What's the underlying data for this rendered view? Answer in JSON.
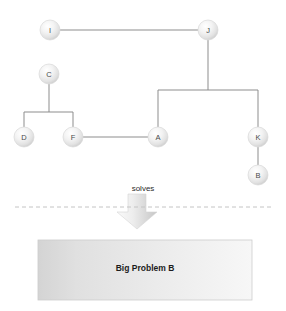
{
  "diagram": {
    "title": "",
    "type": "node-link-graph-with-solves-relation",
    "colors": {
      "background": "#ffffff",
      "edge": "#8d8d8d",
      "node_fill_light": "#fdfdfd",
      "node_fill_mid": "#e8e8e8",
      "node_fill_dark": "#cfcfcf",
      "node_stroke": "#d9d9d9",
      "node_text": "#4a4a4a",
      "divider": "#c8c8c8",
      "arrow_light": "#f2f2f2",
      "arrow_dark": "#c9c9c9",
      "box_left": "#d6d6d6",
      "box_mid": "#e9e9e9",
      "box_right": "#f4f4f4",
      "box_stroke": "#cccccc",
      "box_text": "#1c1c1c",
      "relation_text": "#2b2b2b"
    },
    "nodes": [
      {
        "id": "I",
        "label": "I",
        "x": 50,
        "y": 30,
        "r": 10
      },
      {
        "id": "J",
        "label": "J",
        "x": 208,
        "y": 30,
        "r": 10
      },
      {
        "id": "C",
        "label": "C",
        "x": 49,
        "y": 74,
        "r": 10
      },
      {
        "id": "D",
        "label": "D",
        "x": 24,
        "y": 137,
        "r": 10
      },
      {
        "id": "F",
        "label": "F",
        "x": 73,
        "y": 137,
        "r": 10
      },
      {
        "id": "A",
        "label": "A",
        "x": 158,
        "y": 137,
        "r": 10
      },
      {
        "id": "K",
        "label": "K",
        "x": 258,
        "y": 137,
        "r": 10
      },
      {
        "id": "B",
        "label": "B",
        "x": 258,
        "y": 175,
        "r": 10
      }
    ],
    "edges": [
      {
        "id": "edge-I-J",
        "from": "I",
        "to": "J",
        "path": "M 60 30 L 198 30"
      },
      {
        "id": "edge-J-bus",
        "from": "J",
        "to": "bus",
        "path": "M 208 40 L 208 90"
      },
      {
        "id": "edge-bus-horizontal",
        "from": "A",
        "to": "K",
        "path": "M 158 90 L 258 90"
      },
      {
        "id": "edge-bus-A",
        "from": "bus",
        "to": "A",
        "path": "M 158 90 L 158 127"
      },
      {
        "id": "edge-bus-K",
        "from": "bus",
        "to": "K",
        "path": "M 258 90 L 258 127"
      },
      {
        "id": "edge-K-B",
        "from": "K",
        "to": "B",
        "path": "M 258 147 L 258 165"
      },
      {
        "id": "edge-C-drop",
        "from": "C",
        "to": "cbus",
        "path": "M 49 84 L 49 112"
      },
      {
        "id": "edge-C-bus",
        "from": "D",
        "to": "F",
        "path": "M 24 112 L 73 112"
      },
      {
        "id": "edge-cbus-D",
        "from": "cbus",
        "to": "D",
        "path": "M 24 112 L 24 127"
      },
      {
        "id": "edge-cbus-F",
        "from": "cbus",
        "to": "F",
        "path": "M 73 112 L 73 127"
      },
      {
        "id": "edge-F-A",
        "from": "F",
        "to": "A",
        "path": "M 83 137 L 148 137"
      }
    ],
    "relation": {
      "label": "solves",
      "label_x": 143,
      "label_y": 188,
      "arrow_x": 137,
      "arrow_top": 194,
      "arrow_bottom": 229,
      "shaft_half_width": 9,
      "head_half_width": 20
    },
    "divider": {
      "y": 207,
      "x_start": 15,
      "x_end": 272,
      "dash": "4 3"
    },
    "problem_box": {
      "label": "Big Problem B",
      "x": 38,
      "y": 240,
      "width": 214,
      "height": 60,
      "label_x": 145,
      "label_y": 268
    }
  }
}
